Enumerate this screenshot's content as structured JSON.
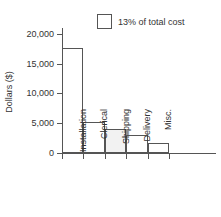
{
  "chart_data": {
    "type": "bar",
    "title": "",
    "xlabel": "",
    "ylabel": "Dollars ($)",
    "categories": [
      "Installation",
      "Clerical",
      "Shipping",
      "Delivery",
      "Misc."
    ],
    "values": [
      17700,
      5200,
      4000,
      3000,
      1700
    ],
    "ylim": [
      0,
      21000
    ],
    "yticks": [
      0,
      5000,
      10000,
      15000,
      20000
    ],
    "ytick_labels": [
      "0",
      "5,000",
      "10,000",
      "15,000",
      "20,000"
    ],
    "grid": false,
    "legend_position": "top-right",
    "legend": [
      {
        "label": "13% of total cost",
        "swatch_fill": "#ffffff",
        "swatch_stroke": "#555555"
      }
    ],
    "highlighted_category": "Shipping",
    "highlight_fill": "#f2f2f2",
    "bar_stroke": "#555555",
    "bar_fill": "#ffffff",
    "axis_color": "#555555",
    "text_color": "#333333",
    "background": "#ffffff"
  },
  "legend": {
    "entry_label": "13% of total cost"
  },
  "axes": {
    "y_title": "Dollars ($)",
    "y_labels": [
      "20,000",
      "15,000",
      "10,000",
      "5,000",
      "0"
    ],
    "x_labels": [
      "Installation",
      "Clerical",
      "Shipping",
      "Delivery",
      "Misc."
    ]
  }
}
